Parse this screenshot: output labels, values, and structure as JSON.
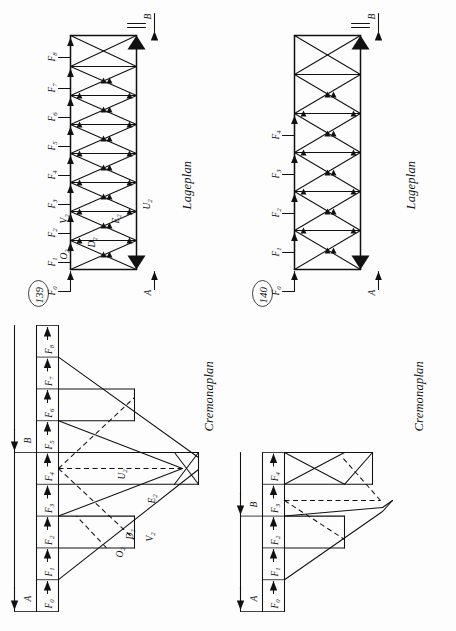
{
  "page": {
    "orientation_deg": -90,
    "background": "#fdfdfd",
    "ink": "#111111"
  },
  "figures": [
    {
      "number": "139",
      "lageplan_caption": "Lageplan",
      "cremonaplan_caption": "Cremonaplan",
      "loads": [
        "F0",
        "F1",
        "F2",
        "F3",
        "F4",
        "F5",
        "F6",
        "F7",
        "F8"
      ],
      "load_labels": [
        {
          "base": "F",
          "sub": "0"
        },
        {
          "base": "F",
          "sub": "1"
        },
        {
          "base": "F",
          "sub": "2"
        },
        {
          "base": "F",
          "sub": "3"
        },
        {
          "base": "F",
          "sub": "4"
        },
        {
          "base": "F",
          "sub": "5"
        },
        {
          "base": "F",
          "sub": "6"
        },
        {
          "base": "F",
          "sub": "7"
        },
        {
          "base": "F",
          "sub": "8"
        }
      ],
      "supports": [
        "A",
        "B"
      ],
      "member_labels": [
        {
          "base": "O",
          "sub": "2"
        },
        {
          "base": "D",
          "sub": "2"
        },
        {
          "base": "V",
          "sub": "2"
        },
        {
          "base": "E",
          "sub": "2"
        },
        {
          "base": "U",
          "sub": "2"
        }
      ],
      "panels": 8,
      "bracing": "cross-diagonal (X) with verticals"
    },
    {
      "number": "140",
      "lageplan_caption": "Lageplan",
      "cremonaplan_caption": "Cremonaplan",
      "loads": [
        "F0",
        "F1",
        "F2",
        "F3",
        "F4"
      ],
      "load_labels": [
        {
          "base": "F",
          "sub": "0"
        },
        {
          "base": "F",
          "sub": "1"
        },
        {
          "base": "F",
          "sub": "2"
        },
        {
          "base": "F",
          "sub": "3"
        },
        {
          "base": "F",
          "sub": "4"
        }
      ],
      "supports": [
        "A",
        "B"
      ],
      "member_labels": [],
      "panels": 4,
      "bracing": "cross-diagonal (X) with verticals"
    }
  ],
  "chart_data": {
    "type": "diagram",
    "fig139": {
      "force_line_segments": [
        "F0",
        "F1",
        "F2",
        "F3",
        "F4",
        "F5",
        "F6",
        "F7",
        "F8"
      ],
      "reaction_A_spans": [
        "F0",
        "F1",
        "F2",
        "F3",
        "F4"
      ],
      "reaction_B_spans": [
        "F4",
        "F5",
        "F6",
        "F7",
        "F8"
      ],
      "labelled_members": [
        "O2",
        "D2",
        "V2",
        "E2",
        "U2"
      ]
    },
    "fig140": {
      "force_line_segments": [
        "F0",
        "F1",
        "F2",
        "F3",
        "F4"
      ],
      "reaction_A_spans": [
        "F0",
        "F1",
        "F2"
      ],
      "reaction_B_spans": [
        "F3",
        "F4"
      ],
      "labelled_members": []
    }
  }
}
